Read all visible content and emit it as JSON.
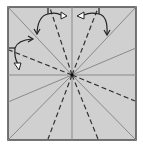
{
  "diagram": {
    "type": "origami-crease-pattern",
    "paper_color": "#d0d0d0",
    "edge_color": "#555555",
    "valley_line_color": "#333333",
    "mountain_line_color": "#8a8a8a",
    "arrow_color": "#222222",
    "square": {
      "x": 8,
      "y": 7,
      "size": 128,
      "height": 133
    },
    "center": {
      "x": 72,
      "y": 75
    },
    "solid_creases": [
      {
        "to": [
          72,
          7
        ]
      },
      {
        "to": [
          72,
          140
        ]
      },
      {
        "to": [
          8,
          75
        ]
      },
      {
        "to": [
          136,
          75
        ]
      },
      {
        "to": [
          8,
          7
        ]
      },
      {
        "to": [
          136,
          7
        ]
      },
      {
        "to": [
          8,
          140
        ]
      },
      {
        "to": [
          136,
          140
        ]
      },
      {
        "to": [
          136,
          48
        ]
      },
      {
        "to": [
          8,
          102
        ]
      }
    ],
    "dashed_creases": [
      {
        "to": [
          50,
          7
        ]
      },
      {
        "to": [
          98,
          7
        ]
      },
      {
        "to": [
          8,
          50
        ]
      },
      {
        "to": [
          136,
          101
        ]
      },
      {
        "to": [
          48,
          140
        ]
      },
      {
        "to": [
          98,
          140
        ]
      }
    ],
    "arrows": [
      {
        "name": "fold-arrow-top-left",
        "description": "curved arrow from top edge down-left"
      },
      {
        "name": "fold-arrow-top-right",
        "description": "curved arrow from top edge down-right"
      },
      {
        "name": "fold-arrow-left",
        "description": "curved arrow from left edge down"
      }
    ]
  }
}
